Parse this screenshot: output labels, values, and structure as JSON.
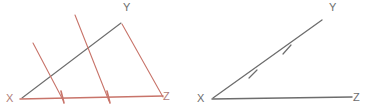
{
  "figure": {
    "colors": {
      "construction_red": "#c8746a",
      "ray_gray": "#6d6d6d",
      "label_gray": "#6d6d6d",
      "label_red": "#b07d78",
      "background": "#ffffff"
    },
    "diagrams": [
      {
        "id": "left-diagram",
        "name": "triangle-with-parallel-construction-lines",
        "labels": {
          "vertex_x": "X",
          "vertex_y": "Y",
          "vertex_z": "Z"
        },
        "label_positions": {
          "vertex_x": {
            "x": 6,
            "y": 102
          },
          "vertex_y": {
            "x": 123,
            "y": 11
          },
          "vertex_z": {
            "x": 163,
            "y": 100
          }
        },
        "segments": [
          {
            "name": "ray-xy",
            "color": "#6d6d6d",
            "x1": 22,
            "y1": 98,
            "x2": 121,
            "y2": 23
          },
          {
            "name": "ray-xz",
            "color": "#c8746a",
            "x1": 20,
            "y1": 99,
            "x2": 163,
            "y2": 96
          },
          {
            "name": "construction-line-1",
            "color": "#c8746a",
            "x1": 33,
            "y1": 43,
            "x2": 63,
            "y2": 100
          },
          {
            "name": "construction-line-2",
            "color": "#c8746a",
            "x1": 75,
            "y1": 15,
            "x2": 109,
            "y2": 101
          },
          {
            "name": "construction-line-3",
            "color": "#c8746a",
            "x1": 122,
            "y1": 24,
            "x2": 163,
            "y2": 97
          }
        ],
        "tick_marks": [
          {
            "name": "tick-xz-1",
            "color": "#c8746a",
            "x1": 61,
            "y1": 91,
            "x2": 64,
            "y2": 103
          },
          {
            "name": "tick-xz-2",
            "color": "#c8746a",
            "x1": 107,
            "y1": 91,
            "x2": 110,
            "y2": 103
          }
        ]
      },
      {
        "id": "right-diagram",
        "name": "angle-with-congruence-ticks",
        "labels": {
          "vertex_x": "X",
          "vertex_y": "Y",
          "vertex_z": "Z"
        },
        "label_positions": {
          "vertex_x": {
            "x": 197,
            "y": 102
          },
          "vertex_y": {
            "x": 329,
            "y": 11
          },
          "vertex_z": {
            "x": 353,
            "y": 101
          }
        },
        "segments": [
          {
            "name": "ray-xy",
            "color": "#6d6d6d",
            "x1": 213,
            "y1": 98,
            "x2": 322,
            "y2": 20
          },
          {
            "name": "ray-xz",
            "color": "#6d6d6d",
            "x1": 212,
            "y1": 99,
            "x2": 352,
            "y2": 97
          }
        ],
        "tick_marks": [
          {
            "name": "tick-xy-1",
            "color": "#6d6d6d",
            "x1": 249,
            "y1": 78,
            "x2": 257,
            "y2": 70
          },
          {
            "name": "tick-xy-2",
            "color": "#6d6d6d",
            "x1": 283,
            "y1": 54,
            "x2": 291,
            "y2": 45
          }
        ]
      }
    ]
  }
}
